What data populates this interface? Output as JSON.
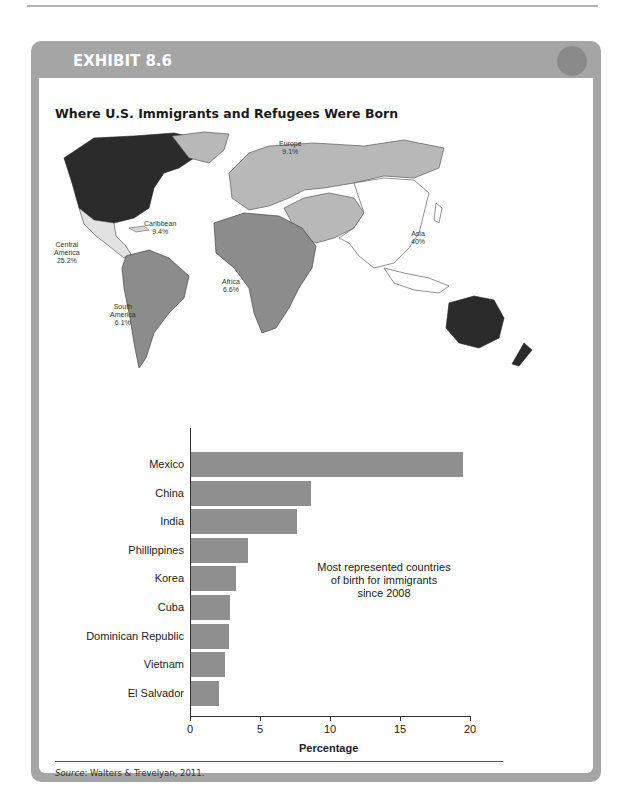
{
  "page": {
    "running_head": "YOUTH FROM THE SOCIAL WELFARE"
  },
  "exhibit": {
    "label": "EXHIBIT 8.6",
    "title": "Where U.S. Immigrants and Refugees Were Born",
    "source_prefix": "Source",
    "source_text": ": Walters & Trevelyan, 2011."
  },
  "map": {
    "regions": [
      {
        "name": "Europe",
        "value": "9.1%",
        "fill": "#b8b8b8"
      },
      {
        "name": "Caribbean",
        "value": "9.4%",
        "fill": "#d8d8d8"
      },
      {
        "name": "Central America",
        "value": "25.2%",
        "fill": "#e2e2e2"
      },
      {
        "name": "South America",
        "value": "6.1%",
        "fill": "#8c8c8c"
      },
      {
        "name": "Africa",
        "value": "6.6%",
        "fill": "#8c8c8c"
      },
      {
        "name": "Asia",
        "value": "40%",
        "fill": "#ffffff"
      }
    ],
    "labels": {
      "europe_name": "Europe",
      "europe_value": "9.1%",
      "caribbean_name": "Caribbean",
      "caribbean_value": "9.4%",
      "central_name_1": "Central",
      "central_name_2": "America",
      "central_value": "25.2%",
      "south_name_1": "South",
      "south_name_2": "America",
      "south_value": "6.1%",
      "africa_name": "Africa",
      "africa_value": "6.6%",
      "asia_name": "Asia",
      "asia_value": "40%"
    },
    "colors": {
      "us_canada_australia": "#2b2b2b",
      "europe_russia": "#b8b8b8",
      "africa_middleeast_southamerica": "#8c8c8c",
      "central_america": "#e2e2e2",
      "asia": "#ffffff"
    }
  },
  "chart_data": {
    "type": "bar",
    "orientation": "horizontal",
    "title": "",
    "annotation": "Most represented countries of birth for immigrants since 2008",
    "categories": [
      "Mexico",
      "China",
      "India",
      "Phillippines",
      "Korea",
      "Cuba",
      "Dominican Republic",
      "Vietnam",
      "El Salvador"
    ],
    "values": [
      19.4,
      8.6,
      7.6,
      4.1,
      3.2,
      2.8,
      2.7,
      2.4,
      2.0
    ],
    "xlabel": "Percentage",
    "ylabel": "",
    "xlim": [
      0,
      20
    ],
    "xticks": [
      "0",
      "5",
      "10",
      "15",
      "20"
    ],
    "grid": false,
    "bar_color": "#8f8f8f"
  },
  "chart_text": {
    "annotation_1": "Most represented countries",
    "annotation_2": "of birth for immigrants",
    "annotation_3": "since 2008"
  }
}
